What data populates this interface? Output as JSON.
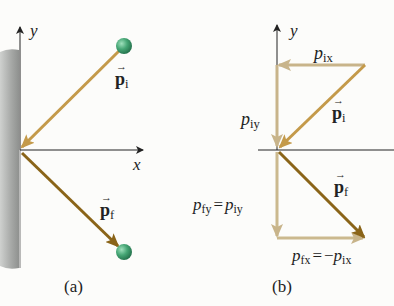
{
  "colors": {
    "arrow_initial": "#c49a4a",
    "arrow_final": "#8a6418",
    "component_initial": "#c8b48a",
    "component_final": "#cbb98e",
    "ball": "#3f9e6e",
    "wall": "#a8aaa8",
    "axis": "#222222"
  },
  "panel_a": {
    "caption": "(a)",
    "axis_y_label": "y",
    "axis_x_label": "x",
    "vector_initial": {
      "symbol": "p",
      "subscript": "i"
    },
    "vector_final": {
      "symbol": "p",
      "subscript": "f"
    }
  },
  "panel_b": {
    "caption": "(b)",
    "axis_y_label": "y",
    "axis_x_label": "x",
    "vector_initial": {
      "symbol": "p",
      "subscript": "i"
    },
    "vector_final": {
      "symbol": "p",
      "subscript": "f"
    },
    "component_pix": {
      "symbol": "p",
      "subscript": "ix"
    },
    "component_piy": {
      "symbol": "p",
      "subscript": "iy"
    },
    "component_pfy": {
      "lhs_symbol": "p",
      "lhs_subscript": "fy",
      "equals": "=",
      "rhs_symbol": "p",
      "rhs_subscript": "iy"
    },
    "component_pfx": {
      "lhs_symbol": "p",
      "lhs_subscript": "fx",
      "equals": "=",
      "rhs_prefix": "−",
      "rhs_symbol": "p",
      "rhs_subscript": "ix"
    }
  }
}
